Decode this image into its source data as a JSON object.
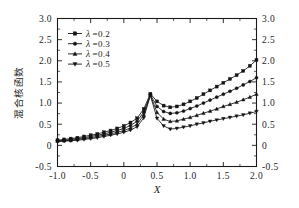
{
  "chart_data": {
    "type": "line",
    "title": "",
    "xlabel": "X",
    "ylabel": "混合核函数",
    "xlim": [
      -1.0,
      2.0
    ],
    "ylim": [
      -0.5,
      3.0
    ],
    "xticks": [
      -1.0,
      -0.5,
      0,
      0.5,
      1.0,
      1.5,
      2.0
    ],
    "xtick_labels": [
      "-1.0",
      "-0.5",
      "0",
      "0.5",
      "1.0",
      "1.5",
      "2.0"
    ],
    "yticks": [
      -0.5,
      0,
      0.5,
      1.0,
      1.5,
      2.0,
      2.5,
      3.0
    ],
    "ytick_labels": [
      "-0.5",
      "0",
      "0.5",
      "1.0",
      "1.5",
      "2.0",
      "2.5",
      "3.0"
    ],
    "grid": false,
    "legend_position": "upper-left",
    "mirrored_y_axis": true,
    "minor_ticks_per_interval": 1,
    "x": [
      -1.0,
      -0.9,
      -0.8,
      -0.7,
      -0.6,
      -0.5,
      -0.4,
      -0.3,
      -0.2,
      -0.1,
      0.0,
      0.1,
      0.2,
      0.3,
      0.4,
      0.5,
      0.6,
      0.7,
      0.8,
      0.9,
      1.0,
      1.1,
      1.2,
      1.3,
      1.4,
      1.5,
      1.6,
      1.7,
      1.8,
      1.9,
      2.0
    ],
    "series": [
      {
        "name": "λ=0.2",
        "lambda": 0.2,
        "marker": "square",
        "values": [
          0.12,
          0.14,
          0.16,
          0.18,
          0.21,
          0.24,
          0.27,
          0.31,
          0.35,
          0.4,
          0.46,
          0.54,
          0.64,
          0.86,
          1.22,
          1.04,
          0.94,
          0.9,
          0.92,
          0.97,
          1.04,
          1.12,
          1.21,
          1.3,
          1.39,
          1.48,
          1.57,
          1.66,
          1.76,
          1.88,
          2.02
        ]
      },
      {
        "name": "λ=0.3",
        "lambda": 0.3,
        "marker": "circle",
        "values": [
          0.11,
          0.12,
          0.14,
          0.16,
          0.18,
          0.21,
          0.24,
          0.27,
          0.31,
          0.35,
          0.4,
          0.47,
          0.57,
          0.79,
          1.2,
          0.92,
          0.8,
          0.755,
          0.77,
          0.81,
          0.87,
          0.93,
          1.0,
          1.07,
          1.14,
          1.21,
          1.28,
          1.35,
          1.43,
          1.51,
          1.6
        ]
      },
      {
        "name": "λ=0.4",
        "lambda": 0.4,
        "marker": "triangle-up",
        "values": [
          0.1,
          0.11,
          0.12,
          0.14,
          0.16,
          0.18,
          0.21,
          0.24,
          0.27,
          0.31,
          0.35,
          0.41,
          0.5,
          0.72,
          1.19,
          0.78,
          0.62,
          0.565,
          0.58,
          0.62,
          0.66,
          0.71,
          0.76,
          0.81,
          0.86,
          0.92,
          0.97,
          1.02,
          1.08,
          1.14,
          1.21
        ]
      },
      {
        "name": "λ=0.5",
        "lambda": 0.5,
        "marker": "triangle-down",
        "values": [
          0.09,
          0.1,
          0.11,
          0.12,
          0.14,
          0.16,
          0.18,
          0.21,
          0.24,
          0.27,
          0.31,
          0.36,
          0.44,
          0.65,
          1.18,
          0.64,
          0.46,
          0.385,
          0.4,
          0.43,
          0.46,
          0.5,
          0.53,
          0.57,
          0.6,
          0.63,
          0.66,
          0.69,
          0.72,
          0.76,
          0.8
        ]
      }
    ]
  },
  "legend": {
    "entries": [
      {
        "lambda_symbol": "λ",
        "text": "=0.2"
      },
      {
        "lambda_symbol": "λ",
        "text": "=0.3"
      },
      {
        "lambda_symbol": "λ",
        "text": "=0.4"
      },
      {
        "lambda_symbol": "λ",
        "text": "=0.5"
      }
    ]
  },
  "axes": {
    "x_title": "X",
    "y_title": "混合核函数"
  }
}
